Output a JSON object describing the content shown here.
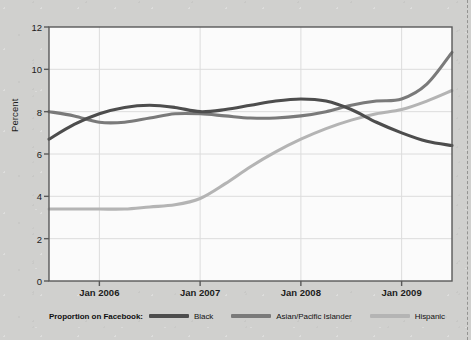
{
  "chart_data": {
    "type": "line",
    "title": "",
    "xlabel": "",
    "ylabel": "Percent",
    "ylim": [
      0,
      12
    ],
    "yticks": [
      0,
      2,
      4,
      6,
      8,
      10,
      12
    ],
    "xticks": [
      "Jan 2006",
      "Jan 2007",
      "Jan 2008",
      "Jan 2009"
    ],
    "xlim": [
      "Jul 2005",
      "Jul 2009"
    ],
    "grid": true,
    "legend_position": "bottom",
    "legend_title": "Proportion on Facebook:",
    "series": [
      {
        "name": "Black",
        "color": "#4d4d4d",
        "x": [
          "Jul 2005",
          "Oct 2005",
          "Jan 2006",
          "Apr 2006",
          "Jul 2006",
          "Oct 2006",
          "Jan 2007",
          "Apr 2007",
          "Jul 2007",
          "Oct 2007",
          "Jan 2008",
          "Apr 2008",
          "Jul 2008",
          "Oct 2008",
          "Jan 2009",
          "Apr 2009",
          "Jul 2009"
        ],
        "values": [
          6.7,
          7.4,
          7.9,
          8.2,
          8.3,
          8.2,
          8.0,
          8.1,
          8.3,
          8.5,
          8.6,
          8.5,
          8.1,
          7.5,
          7.0,
          6.6,
          6.4
        ]
      },
      {
        "name": "Asian/Pacific Islander",
        "color": "#7a7a7a",
        "x": [
          "Jul 2005",
          "Oct 2005",
          "Jan 2006",
          "Apr 2006",
          "Jul 2006",
          "Oct 2006",
          "Jan 2007",
          "Apr 2007",
          "Jul 2007",
          "Oct 2007",
          "Jan 2008",
          "Apr 2008",
          "Jul 2008",
          "Oct 2008",
          "Jan 2009",
          "Apr 2009",
          "Jul 2009"
        ],
        "values": [
          8.0,
          7.8,
          7.5,
          7.5,
          7.7,
          7.9,
          7.9,
          7.8,
          7.7,
          7.7,
          7.8,
          8.0,
          8.3,
          8.5,
          8.6,
          9.3,
          10.8
        ]
      },
      {
        "name": "Hispanic",
        "color": "#b4b4b4",
        "x": [
          "Jul 2005",
          "Oct 2005",
          "Jan 2006",
          "Apr 2006",
          "Jul 2006",
          "Oct 2006",
          "Jan 2007",
          "Apr 2007",
          "Jul 2007",
          "Oct 2007",
          "Jan 2008",
          "Apr 2008",
          "Jul 2008",
          "Oct 2008",
          "Jan 2009",
          "Apr 2009",
          "Jul 2009"
        ],
        "values": [
          3.4,
          3.4,
          3.4,
          3.4,
          3.5,
          3.6,
          3.9,
          4.6,
          5.4,
          6.1,
          6.7,
          7.2,
          7.6,
          7.9,
          8.1,
          8.5,
          9.0
        ]
      }
    ]
  },
  "axis": {
    "ylabel": "Percent",
    "ytick_labels": [
      "0",
      "2",
      "4",
      "6",
      "8",
      "10",
      "12"
    ],
    "xtick_labels": [
      "Jan 2006",
      "Jan 2007",
      "Jan 2008",
      "Jan 2009"
    ]
  },
  "legend": {
    "title": "Proportion on Facebook:",
    "items": [
      {
        "label": "Black",
        "color": "#4d4d4d"
      },
      {
        "label": "Asian/Pacific Islander",
        "color": "#7a7a7a"
      },
      {
        "label": "Hispanic",
        "color": "#b4b4b4"
      }
    ]
  },
  "colors": {
    "page_background": "#d0d0ce",
    "plot_background": "#fbfbfb",
    "frame": "#595959",
    "gridline": "#dcdcdc"
  }
}
